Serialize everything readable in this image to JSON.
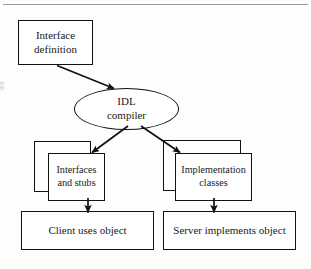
{
  "figure": {
    "type": "flow-diagram",
    "title_visible": false,
    "background_color": "#fdfdfb",
    "line_color": "#111111",
    "text_color": "#1a1a1a",
    "top_rule": {
      "visible": true,
      "color": "#9a9a9a"
    }
  },
  "nodes": {
    "interface_definition": {
      "label": "Interface\ndefinition",
      "shape": "rectangle",
      "x": 18,
      "y": 20,
      "w": 75,
      "h": 45
    },
    "idl_compiler": {
      "label": "IDL\ncompiler",
      "shape": "ellipse",
      "x": 74,
      "y": 88,
      "w": 105,
      "h": 42
    },
    "interfaces_and_stubs_back": {
      "label": "",
      "shape": "rectangle",
      "x": 34,
      "y": 141,
      "w": 57,
      "h": 51
    },
    "interfaces_and_stubs": {
      "label": "Interfaces\nand stubs",
      "shape": "rectangle",
      "x": 48,
      "y": 153,
      "w": 57,
      "h": 48
    },
    "implementation_classes_back": {
      "label": "",
      "shape": "rectangle",
      "x": 163,
      "y": 140,
      "w": 78,
      "h": 51
    },
    "implementation_classes": {
      "label": "Implementation\nclasses",
      "shape": "rectangle",
      "x": 175,
      "y": 153,
      "w": 77,
      "h": 48
    },
    "client_uses_object": {
      "label": "Client uses object",
      "shape": "rectangle",
      "x": 21,
      "y": 211,
      "w": 133,
      "h": 39
    },
    "server_implements_object": {
      "label": "Server implements object",
      "shape": "rectangle",
      "x": 163,
      "y": 211,
      "w": 133,
      "h": 39
    }
  },
  "edges": [
    {
      "name": "interface-definition-to-idl-compiler",
      "from": "interface_definition",
      "to": "idl_compiler",
      "style": "solid-arrow"
    },
    {
      "name": "idl-compiler-to-interfaces-and-stubs",
      "from": "idl_compiler",
      "to": "interfaces_and_stubs",
      "style": "solid-arrow"
    },
    {
      "name": "idl-compiler-to-implementation-classes",
      "from": "idl_compiler",
      "to": "implementation_classes",
      "style": "solid-arrow"
    },
    {
      "name": "interfaces-and-stubs-to-client",
      "from": "interfaces_and_stubs",
      "to": "client_uses_object",
      "style": "solid-arrow"
    },
    {
      "name": "implementation-classes-to-server",
      "from": "implementation_classes",
      "to": "server_implements_object",
      "style": "solid-arrow"
    }
  ]
}
